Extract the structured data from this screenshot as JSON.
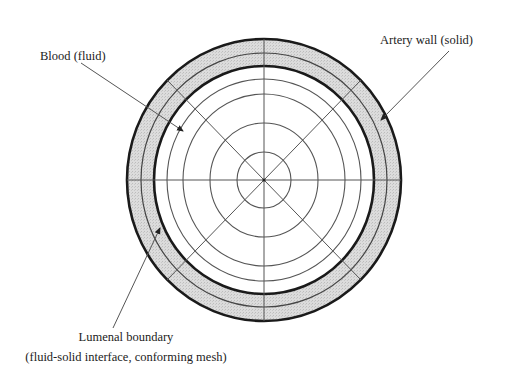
{
  "diagram": {
    "labels": {
      "blood": "Blood (fluid)",
      "artery_wall": "Artery wall (solid)",
      "lumenal_line1": "Lumenal boundary",
      "lumenal_line2": "(fluid-solid interface, conforming mesh)"
    },
    "colors": {
      "wall_fill": "#d9d9d9",
      "stroke": "#222222",
      "thin_stroke": "#555555",
      "background": "#ffffff"
    }
  }
}
